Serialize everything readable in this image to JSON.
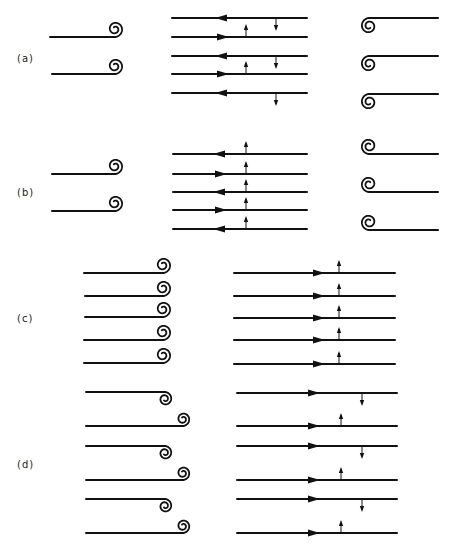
{
  "figure": {
    "panels": [
      {
        "label": "(a)",
        "label_pos": [
          17,
          62
        ],
        "left": {
          "lines": [
            {
              "y": 37,
              "x1": 50,
              "x2": 115,
              "curl": "up"
            },
            {
              "y": 74,
              "x1": 52,
              "x2": 115,
              "curl": "up"
            }
          ]
        },
        "middle": {
          "x1": 172,
          "x2": 307,
          "arrow_x": 222,
          "lines": [
            {
              "y": 18,
              "dir": "left",
              "marker": "down",
              "marker_x": 276
            },
            {
              "y": 37,
              "dir": "right",
              "marker": "up",
              "marker_x": 246
            },
            {
              "y": 56,
              "dir": "left",
              "marker": "down",
              "marker_x": 276
            },
            {
              "y": 74,
              "dir": "right",
              "marker": "up",
              "marker_x": 246
            },
            {
              "y": 93,
              "dir": "left",
              "marker": "down",
              "marker_x": 276
            }
          ]
        },
        "right": {
          "lines": [
            {
              "y": 18,
              "x1": 365,
              "x2": 438,
              "curl": "down"
            },
            {
              "y": 56,
              "x1": 365,
              "x2": 438,
              "curl": "down"
            },
            {
              "y": 94,
              "x1": 365,
              "x2": 438,
              "curl": "down"
            }
          ]
        }
      },
      {
        "label": "(b)",
        "label_pos": [
          17,
          196
        ],
        "left": {
          "lines": [
            {
              "y": 174,
              "x1": 52,
              "x2": 115,
              "curl": "up"
            },
            {
              "y": 211,
              "x1": 52,
              "x2": 115,
              "curl": "up"
            }
          ]
        },
        "middle": {
          "x1": 173,
          "x2": 307,
          "arrow_x": 220,
          "lines": [
            {
              "y": 154,
              "dir": "left",
              "marker": "up",
              "marker_x": 246
            },
            {
              "y": 174,
              "dir": "right",
              "marker": "up",
              "marker_x": 246
            },
            {
              "y": 192,
              "dir": "left",
              "marker": "up",
              "marker_x": 246
            },
            {
              "y": 210,
              "dir": "right",
              "marker": "up",
              "marker_x": 246
            },
            {
              "y": 229,
              "dir": "left",
              "marker": "up",
              "marker_x": 246
            }
          ]
        },
        "right": {
          "lines": [
            {
              "y": 154,
              "x1": 365,
              "x2": 438,
              "curl": "up"
            },
            {
              "y": 192,
              "x1": 365,
              "x2": 438,
              "curl": "up"
            },
            {
              "y": 230,
              "x1": 365,
              "x2": 438,
              "curl": "up"
            }
          ]
        }
      },
      {
        "label": "(c)",
        "label_pos": [
          17,
          322
        ],
        "left": {
          "lines": [
            {
              "y": 273,
              "x1": 84,
              "x2": 163,
              "curl": "up"
            },
            {
              "y": 296,
              "x1": 85,
              "x2": 163,
              "curl": "up"
            },
            {
              "y": 317,
              "x1": 85,
              "x2": 163,
              "curl": "up"
            },
            {
              "y": 340,
              "x1": 84,
              "x2": 163,
              "curl": "up"
            },
            {
              "y": 363,
              "x1": 84,
              "x2": 163,
              "curl": "up"
            }
          ]
        },
        "middle": {
          "x1": 234,
          "x2": 395,
          "arrow_x": 318,
          "lines": [
            {
              "y": 273,
              "dir": "right",
              "marker": "up",
              "marker_x": 339
            },
            {
              "y": 296,
              "dir": "right",
              "marker": "up",
              "marker_x": 339
            },
            {
              "y": 318,
              "dir": "right",
              "marker": "up",
              "marker_x": 339
            },
            {
              "y": 340,
              "dir": "right",
              "marker": "up",
              "marker_x": 339
            },
            {
              "y": 364,
              "dir": "right",
              "marker": "up",
              "marker_x": 339
            }
          ]
        }
      },
      {
        "label": "(d)",
        "label_pos": [
          17,
          468
        ],
        "left": {
          "pairs": [
            {
              "top_y": 392,
              "bottom_y": 426
            },
            {
              "top_y": 446,
              "bottom_y": 480
            },
            {
              "top_y": 499,
              "bottom_y": 533
            }
          ],
          "x1": 86,
          "top_x2": 165,
          "bottom_x2": 183
        },
        "middle": {
          "x1": 237,
          "x2": 397,
          "arrow_x": 313,
          "lines": [
            {
              "y": 393,
              "dir": "right",
              "marker": "down",
              "marker_x": 362
            },
            {
              "y": 426,
              "dir": "right",
              "marker": "up",
              "marker_x": 341
            },
            {
              "y": 446,
              "dir": "right",
              "marker": "down",
              "marker_x": 362
            },
            {
              "y": 480,
              "dir": "right",
              "marker": "up",
              "marker_x": 341
            },
            {
              "y": 499,
              "dir": "right",
              "marker": "down",
              "marker_x": 362
            },
            {
              "y": 533,
              "dir": "right",
              "marker": "up",
              "marker_x": 341
            }
          ]
        }
      }
    ]
  }
}
